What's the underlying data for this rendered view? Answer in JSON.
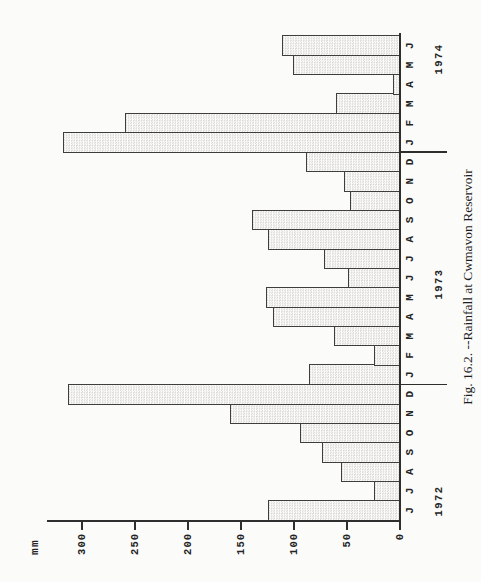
{
  "figure": {
    "caption": "Fig. 16.2. --Rainfall at Cwmavon Reservoir",
    "page_orientation": "chart printed sideways, rotated 90 degrees counterclockwise"
  },
  "chart_data": {
    "type": "bar",
    "title": "Fig. 16.2. --Rainfall at Cwmavon Reservoir",
    "ylabel": "mm",
    "xlabel": "",
    "ylim": [
      0,
      335
    ],
    "yticks": [
      0,
      50,
      100,
      150,
      200,
      250,
      300
    ],
    "grid": false,
    "legend": "none",
    "categories": [
      "J",
      "J",
      "A",
      "S",
      "O",
      "N",
      "D",
      "J",
      "F",
      "M",
      "A",
      "M",
      "J",
      "J",
      "A",
      "S",
      "O",
      "N",
      "D",
      "J",
      "F",
      "M",
      "A",
      "M",
      "J"
    ],
    "values": [
      125,
      25,
      56,
      74,
      94,
      160,
      313,
      86,
      25,
      62,
      120,
      126,
      49,
      72,
      125,
      140,
      47,
      53,
      89,
      318,
      259,
      60,
      7,
      101,
      111
    ],
    "year_groups": [
      {
        "label": "1972",
        "start_index": 0,
        "month_count": 7
      },
      {
        "label": "1973",
        "start_index": 7,
        "month_count": 12
      },
      {
        "label": "1974",
        "start_index": 19,
        "month_count": 6
      }
    ],
    "bar_style": "light gray halftone fill with dark outline"
  },
  "colors": {
    "background": "#fbfbfa",
    "axis": "#2e2e2e",
    "text": "#242424",
    "bar_edge": "#3e3e3c",
    "bar_fill_dot": "#d9d8d4",
    "bar_fill_base": "#ffffff"
  }
}
